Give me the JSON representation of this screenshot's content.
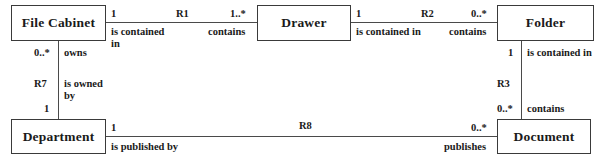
{
  "diagram": {
    "type": "entity-relationship-diagram",
    "background_color": "#ffffff",
    "line_color": "#4a4a4a",
    "text_color": "#1a1a1a",
    "entities": [
      {
        "id": "file_cabinet",
        "label": "File Cabinet"
      },
      {
        "id": "drawer",
        "label": "Drawer"
      },
      {
        "id": "folder",
        "label": "Folder"
      },
      {
        "id": "department",
        "label": "Department"
      },
      {
        "id": "document",
        "label": "Document"
      }
    ],
    "relationships": [
      {
        "id": "R1",
        "label": "R1",
        "from": "File Cabinet",
        "to": "Drawer",
        "from_multiplicity": "1",
        "from_role": "is contained in",
        "to_multiplicity": "1..*",
        "to_role": "contains"
      },
      {
        "id": "R2",
        "label": "R2",
        "from": "Drawer",
        "to": "Folder",
        "from_multiplicity": "1",
        "from_role": "is contained in",
        "to_multiplicity": "0..*",
        "to_role": "contains"
      },
      {
        "id": "R7",
        "label": "R7",
        "from": "File Cabinet",
        "to": "Department",
        "from_multiplicity": "0..*",
        "from_role": "owns",
        "to_multiplicity": "1",
        "to_role": "is owned by"
      },
      {
        "id": "R3",
        "label": "R3",
        "from": "Folder",
        "to": "Document",
        "from_multiplicity": "1",
        "from_role": "is contained in",
        "to_multiplicity": "0..*",
        "to_role": "contains"
      },
      {
        "id": "R8",
        "label": "R8",
        "from": "Department",
        "to": "Document",
        "from_multiplicity": "1",
        "from_role": "is published by",
        "to_multiplicity": "0..*",
        "to_role": "publishes"
      }
    ],
    "labels": {
      "r1_name": "R1",
      "r1_left_mult": "1",
      "r1_left_role": "is contained in",
      "r1_right_mult": "1..*",
      "r1_right_role": "contains",
      "r2_name": "R2",
      "r2_left_mult": "1",
      "r2_left_role": "is contained in",
      "r2_right_mult": "0..*",
      "r2_right_role": "contains",
      "r7_name": "R7",
      "r7_top_mult": "0..*",
      "r7_top_role": "owns",
      "r7_bottom_mult": "1",
      "r7_bottom_role": "is owned by",
      "r3_name": "R3",
      "r3_top_mult": "1",
      "r3_top_role": "is contained in",
      "r3_bottom_mult": "0..*",
      "r3_bottom_role": "contains",
      "r8_name": "R8",
      "r8_left_mult": "1",
      "r8_left_role": "is published by",
      "r8_right_mult": "0..*",
      "r8_right_role": "publishes"
    }
  }
}
